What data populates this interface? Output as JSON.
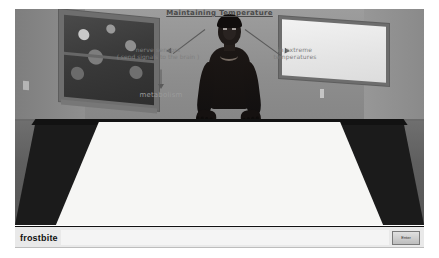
{
  "app": {
    "title": "Maintaining Temperature",
    "scene_description": "Classroom 3D simulation"
  },
  "scene": {
    "window": {
      "name": "window",
      "view": "outdoor-foliage"
    },
    "whiteboard": {
      "name": "whiteboard",
      "content": ""
    },
    "character": {
      "name": "student-avatar"
    },
    "table": {
      "name": "table",
      "surface": "dark"
    }
  },
  "worksheet": {
    "title": "Maintaining Temperature",
    "branch_left": "nerve sensors",
    "branch_left_detail": "( send signals to\nthe brain )",
    "branch_right": "in extreme\ntemperatures",
    "branch_bottom": "metabolism"
  },
  "bottom_bar": {
    "label": "frostbite",
    "input_value": "",
    "input_placeholder": "",
    "enter_label": "Enter"
  },
  "colors": {
    "wall": "#8e8e8e",
    "floor": "#5f5f5f",
    "table": "#1b1b1b",
    "paper": "#f6f6f4",
    "ui_bar": "#e9e9e9",
    "ink": "#8c8c8c"
  }
}
